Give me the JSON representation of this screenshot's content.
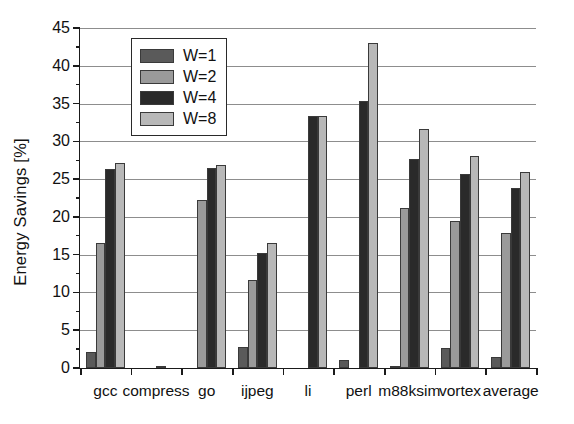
{
  "chart_data": {
    "type": "bar",
    "title": "",
    "subtitle": "",
    "xlabel": "",
    "ylabel": "Energy Savings [%]",
    "ylim": [
      0,
      45
    ],
    "ytick_step": 5,
    "yminor_step": 2.5,
    "grid": true,
    "legend_position": "top-left-inside",
    "categories": [
      "gcc",
      "compress",
      "go",
      "ijpeg",
      "li",
      "perl",
      "m88ksim",
      "vortex",
      "average"
    ],
    "series": [
      {
        "name": "W=1",
        "color": "#5a5a5a",
        "values": [
          2.1,
          0.0,
          0.0,
          2.8,
          0.0,
          1.0,
          0.3,
          2.6,
          1.5
        ]
      },
      {
        "name": "W=2",
        "color": "#9a9a9a",
        "values": [
          16.5,
          0.0,
          22.3,
          11.6,
          0.0,
          0.0,
          21.2,
          19.4,
          17.9
        ]
      },
      {
        "name": "W=4",
        "color": "#2a2a2a",
        "values": [
          26.3,
          0.3,
          26.5,
          15.2,
          33.3,
          35.4,
          27.7,
          25.7,
          23.8
        ]
      },
      {
        "name": "W=8",
        "color": "#b8b8b8",
        "values": [
          27.2,
          0.0,
          26.9,
          16.6,
          33.3,
          43.0,
          31.7,
          28.0,
          26.0
        ]
      }
    ],
    "ytick_labels": [
      "0",
      "5",
      "10",
      "15",
      "20",
      "25",
      "30",
      "35",
      "40",
      "45"
    ],
    "annotations": []
  },
  "legend": {
    "entries": [
      {
        "label": "W=1"
      },
      {
        "label": "W=2"
      },
      {
        "label": "W=4"
      },
      {
        "label": "W=8"
      }
    ]
  }
}
